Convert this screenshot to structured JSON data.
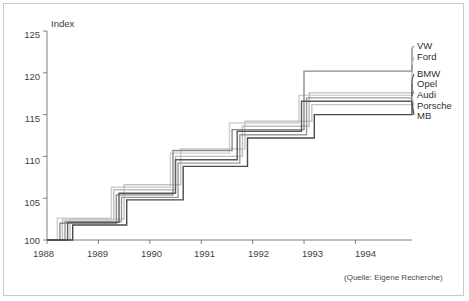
{
  "figure": {
    "axis_title": "Index",
    "source_note": "(Quelle: Eigene Recherche)"
  },
  "legend": {
    "items": [
      {
        "label": "VW",
        "color": "#8c8c8c"
      },
      {
        "label": "Ford",
        "color": "#bdbdbd"
      },
      {
        "label": "BMW",
        "color": "#5a5a5a"
      },
      {
        "label": "Opel",
        "color": "#cfcfcf"
      },
      {
        "label": "Audi",
        "color": "#9a9a9a"
      },
      {
        "label": "Porsche",
        "color": "#c4c4c4"
      },
      {
        "label": "MB",
        "color": "#4a4a4a"
      }
    ]
  },
  "axes": {
    "y_ticks": [
      "125",
      "120",
      "115",
      "110",
      "105",
      "100"
    ],
    "x_ticks": [
      "1988",
      "1989",
      "1990",
      "1991",
      "1992",
      "1993",
      "1994"
    ]
  },
  "chart_data": {
    "type": "line",
    "title": "",
    "subtitle": "",
    "xlabel": "",
    "ylabel": "Index",
    "xlim": [
      1988,
      1995.1
    ],
    "ylim": [
      100,
      125
    ],
    "grid": false,
    "legend_position": "right",
    "step": "post",
    "annotations": [
      "(Quelle: Eigene Recherche)"
    ],
    "x_tick_values": [
      1988,
      1989,
      1990,
      1991,
      1992,
      1993,
      1994
    ],
    "y_tick_values": [
      100,
      105,
      110,
      115,
      120,
      125
    ],
    "series": [
      {
        "name": "VW",
        "color": "#8c8c8c",
        "x": [
          1988.0,
          1988.25,
          1988.9,
          1989.35,
          1990.0,
          1990.45,
          1991.2,
          1991.6,
          1992.35,
          1993.0,
          1994.55,
          1995.1
        ],
        "y": [
          100.0,
          102.0,
          102.0,
          105.4,
          105.4,
          110.7,
          110.7,
          113.2,
          113.2,
          120.2,
          120.2,
          123.0
        ]
      },
      {
        "name": "Ford",
        "color": "#bdbdbd",
        "x": [
          1988.0,
          1988.3,
          1988.85,
          1989.3,
          1989.95,
          1990.5,
          1991.3,
          1991.8,
          1992.5,
          1993.1,
          1994.6,
          1995.1
        ],
        "y": [
          100.0,
          102.4,
          102.4,
          106.0,
          106.0,
          110.0,
          110.0,
          113.6,
          113.6,
          117.6,
          117.6,
          121.0
        ]
      },
      {
        "name": "BMW",
        "color": "#5a5a5a",
        "x": [
          1988.0,
          1988.4,
          1988.95,
          1989.4,
          1990.05,
          1990.5,
          1991.25,
          1991.7,
          1992.4,
          1992.95,
          1994.5,
          1995.1
        ],
        "y": [
          100.0,
          102.1,
          102.1,
          105.6,
          105.6,
          109.6,
          109.6,
          113.0,
          113.0,
          116.6,
          116.6,
          119.2
        ]
      },
      {
        "name": "Opel",
        "color": "#cfcfcf",
        "x": [
          1988.0,
          1988.2,
          1988.8,
          1989.25,
          1989.85,
          1990.4,
          1991.15,
          1991.55,
          1992.3,
          1992.9,
          1994.65,
          1995.1
        ],
        "y": [
          100.0,
          102.6,
          102.6,
          106.3,
          106.3,
          110.4,
          110.4,
          114.0,
          114.0,
          117.3,
          117.3,
          118.9
        ]
      },
      {
        "name": "Audi",
        "color": "#9a9a9a",
        "x": [
          1988.0,
          1988.35,
          1988.9,
          1989.45,
          1990.1,
          1990.55,
          1991.35,
          1991.75,
          1992.45,
          1993.05,
          1994.7,
          1995.1
        ],
        "y": [
          100.0,
          102.2,
          102.2,
          105.1,
          105.1,
          109.2,
          109.2,
          112.6,
          112.6,
          117.0,
          117.0,
          118.2
        ]
      },
      {
        "name": "Porsche",
        "color": "#c4c4c4",
        "x": [
          1988.0,
          1988.45,
          1989.0,
          1989.5,
          1990.15,
          1990.6,
          1991.4,
          1991.85,
          1992.55,
          1993.15,
          1994.75,
          1995.1
        ],
        "y": [
          100.0,
          102.5,
          102.5,
          106.6,
          106.6,
          110.9,
          110.9,
          114.2,
          114.2,
          116.2,
          116.2,
          117.2
        ]
      },
      {
        "name": "MB",
        "color": "#4a4a4a",
        "x": [
          1988.0,
          1988.5,
          1989.05,
          1989.55,
          1990.2,
          1990.65,
          1991.45,
          1991.9,
          1992.6,
          1993.2,
          1994.4,
          1995.1
        ],
        "y": [
          100.0,
          101.8,
          101.8,
          104.8,
          104.8,
          108.8,
          108.8,
          112.2,
          112.2,
          115.0,
          115.0,
          116.5
        ]
      }
    ]
  }
}
